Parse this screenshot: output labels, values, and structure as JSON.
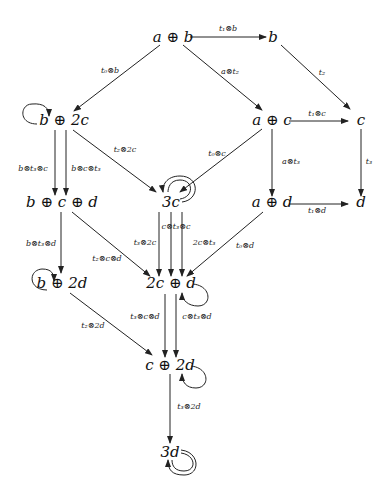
{
  "nodes": [
    {
      "id": "a_b",
      "label": "a ⊕ b"
    },
    {
      "id": "b",
      "label": "b"
    },
    {
      "id": "b_2c",
      "label": "b ⊕ 2c"
    },
    {
      "id": "a_c",
      "label": "a ⊕ c"
    },
    {
      "id": "c",
      "label": "c"
    },
    {
      "id": "b_c_d",
      "label": "b ⊕ c ⊕ d"
    },
    {
      "id": "3c",
      "label": "3c"
    },
    {
      "id": "a_d",
      "label": "a ⊕ d"
    },
    {
      "id": "d",
      "label": "d"
    },
    {
      "id": "b_2d",
      "label": "b ⊕ 2d"
    },
    {
      "id": "2c_d",
      "label": "2c ⊕ d"
    },
    {
      "id": "c_2d",
      "label": "c ⊕ 2d"
    },
    {
      "id": "3d",
      "label": "3d"
    }
  ],
  "edges": [
    {
      "from": "a_b",
      "to": "b",
      "label": "t₁⊗b"
    },
    {
      "from": "a_b",
      "to": "b_2c",
      "label": "t₀⊗b"
    },
    {
      "from": "a_b",
      "to": "a_c",
      "label": "a⊗t₂"
    },
    {
      "from": "b",
      "to": "c",
      "label": "t₂"
    },
    {
      "from": "a_c",
      "to": "c",
      "label": "t₁⊗c"
    },
    {
      "from": "a_c",
      "to": "3c",
      "label": "t₀⊗c"
    },
    {
      "from": "a_c",
      "to": "a_d",
      "label": "a⊗t₃"
    },
    {
      "from": "c",
      "to": "d",
      "label": "t₃"
    },
    {
      "from": "a_d",
      "to": "d",
      "label": "t₁⊗d"
    },
    {
      "from": "a_d",
      "to": "2c_d",
      "label": "t₀⊗d"
    },
    {
      "from": "b_2c",
      "to": "b_c_d",
      "label": "b⊗t₃⊗c"
    },
    {
      "from": "b_2c",
      "to": "b_c_d",
      "label": "b⊗c⊗t₃"
    },
    {
      "from": "b_2c",
      "to": "3c",
      "label": "t₂⊗2c"
    },
    {
      "from": "b_c_d",
      "to": "b_2d",
      "label": "b⊗t₃⊗d"
    },
    {
      "from": "b_c_d",
      "to": "2c_d",
      "label": "t₂⊗c⊗d"
    },
    {
      "from": "3c",
      "to": "2c_d",
      "label": "t₃⊗2c"
    },
    {
      "from": "3c",
      "to": "2c_d",
      "label": "c⊗t₃⊗c"
    },
    {
      "from": "3c",
      "to": "2c_d",
      "label": "2c⊗t₃"
    },
    {
      "from": "b_2d",
      "to": "c_2d",
      "label": "t₂⊗2d"
    },
    {
      "from": "2c_d",
      "to": "c_2d",
      "label": "t₃⊗c⊗d"
    },
    {
      "from": "2c_d",
      "to": "c_2d",
      "label": "c⊗t₃⊗d"
    },
    {
      "from": "c_2d",
      "to": "3d",
      "label": "t₃⊗2d"
    }
  ],
  "loops": [
    {
      "node": "b_2c",
      "count": 1
    },
    {
      "node": "3c",
      "count": 2
    },
    {
      "node": "2c_d",
      "count": 1
    },
    {
      "node": "b_2d",
      "count": 1
    },
    {
      "node": "c_2d",
      "count": 1
    },
    {
      "node": "3d",
      "count": 2
    }
  ]
}
